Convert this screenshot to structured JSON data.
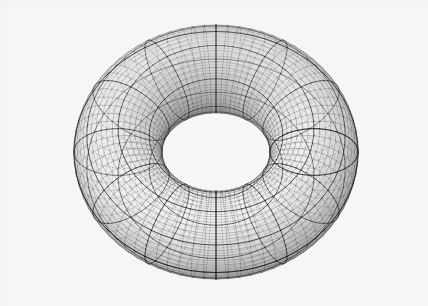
{
  "figure": {
    "kind": "3d-wireframe-mesh",
    "canvas": {
      "width": 428,
      "height": 306
    },
    "background_color": "#f6f6f6",
    "artifact_text": "",
    "caption": ""
  },
  "chart_data": {
    "type": "surface-mesh-3d",
    "surface": "torus",
    "parametric_form": "x=(R+r*cos(v))*cos(u), y=(R+r*cos(v))*sin(u), z=r*sin(v)",
    "major_radius_R": 1.0,
    "minor_radius_r": 0.45,
    "u_range_deg": [
      0,
      360
    ],
    "v_range_deg": [
      0,
      360
    ],
    "u_divisions": 72,
    "v_divisions": 48,
    "accent_every_u": 6,
    "accent_every_v": 6,
    "projection": "orthographic",
    "camera": {
      "elevation_deg": 32,
      "azimuth_deg": 0,
      "roll_deg": 0
    },
    "screen_center": {
      "x": 216,
      "y": 152
    },
    "screen_scale_x": 196,
    "screen_scale_y": 196,
    "silhouette_bbox": {
      "x0": 20,
      "y0": 20,
      "x1": 412,
      "y1": 288
    },
    "inner_hole_center": {
      "x": 215,
      "y": 68
    },
    "inner_hole_radii": {
      "rx": 78,
      "ry": 32
    },
    "shading": {
      "model": "depth-and-normal lambert, grayscale",
      "light_direction": [
        -0.45,
        -0.75,
        0.5
      ],
      "face_fill_light": "#f0f0f0",
      "face_fill_dark": "#3a3a3a",
      "minor_line_color": "#4a4a4a",
      "major_line_color": "#1c1c1c",
      "minor_line_width": 0.35,
      "major_line_width": 0.85
    },
    "xlabel": "",
    "ylabel": "",
    "zlabel": "",
    "legend": [],
    "grid": true,
    "axes_visible": false,
    "tick_labels": []
  }
}
